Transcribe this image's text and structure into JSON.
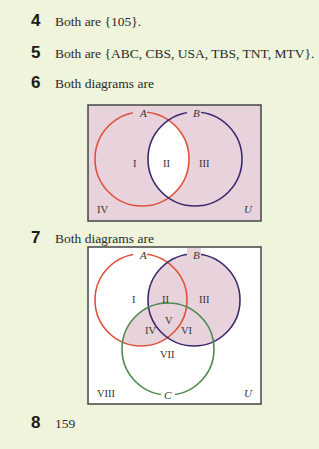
{
  "items": [
    {
      "number": "4",
      "text": "Both are {105}."
    },
    {
      "number": "5",
      "text": "Both are {ABC, CBS, USA, TBS, TNT, MTV}."
    },
    {
      "number": "6",
      "text": "Both diagrams are"
    },
    {
      "number": "7",
      "text": "Both diagrams are"
    },
    {
      "number": "8",
      "text": "159"
    }
  ],
  "diagram1": {
    "sets": [
      "A",
      "B"
    ],
    "regions": [
      "I",
      "II",
      "III",
      "IV"
    ],
    "universe_label": "U",
    "shaded_regions": [
      "I",
      "III",
      "IV"
    ],
    "colors": {
      "shade": "#e8d3dd",
      "set_a": "#e0503a",
      "set_b": "#3b2a6e",
      "border": "#444444"
    }
  },
  "diagram2": {
    "sets": [
      "A",
      "B",
      "C"
    ],
    "regions": [
      "I",
      "II",
      "III",
      "IV",
      "V",
      "VI",
      "VII",
      "VIII"
    ],
    "universe_label": "U",
    "shaded_regions": [
      "II",
      "III",
      "IV",
      "V",
      "VI"
    ],
    "colors": {
      "shade": "#e8d3dd",
      "set_a": "#e0503a",
      "set_b": "#3b2a6e",
      "set_c": "#4f8a4f",
      "border": "#444444"
    }
  }
}
